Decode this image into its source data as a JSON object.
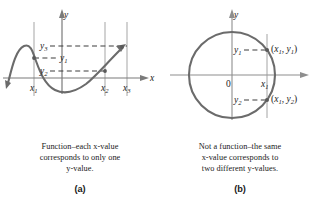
{
  "figure_a": {
    "name": "function-graph",
    "axis_labels": {
      "x": "x",
      "y": "y"
    },
    "y_ticks": [
      "y3",
      "y1",
      "y2"
    ],
    "x_ticks": [
      "x1",
      "x2",
      "x3"
    ],
    "y_tick_base": "y",
    "x_tick_base": "x",
    "y_tick_subs": [
      "3",
      "1",
      "2"
    ],
    "x_tick_subs": [
      "1",
      "2",
      "3"
    ],
    "caption_line1": "Function–each x-value",
    "caption_line2": "corresponds to only one",
    "caption_line3": "y-value.",
    "caption_full": "Function–each x-value corresponds to only one y-value.",
    "sublabel": "(a)",
    "curve_color": "#6b6b6b",
    "axis_color": "#6b6b6b",
    "grid_color": "#8e8e8e",
    "dash_color": "#4a4a4a"
  },
  "figure_b": {
    "name": "not-a-function-graph",
    "axis_labels": {
      "x": "",
      "y": "y"
    },
    "origin_label": "0",
    "y_ticks": [
      "y1",
      "y2"
    ],
    "x_ticks": [
      "x1"
    ],
    "y_tick_base": "y",
    "x_tick_base": "x",
    "y_tick_subs": [
      "1",
      "2"
    ],
    "x_tick_subs": [
      "1"
    ],
    "point_upper": "(x1, y1)",
    "point_lower": "(x1, y2)",
    "point_upper_parts": {
      "open": "(",
      "x": "x",
      "xs": "1",
      "comma": ", ",
      "y": "y",
      "ys": "1",
      "close": ")"
    },
    "point_lower_parts": {
      "open": "(",
      "x": "x",
      "xs": "1",
      "comma": ", ",
      "y": "y",
      "ys": "2",
      "close": ")"
    },
    "caption_line1": "Not a function–the same",
    "caption_line2": "x-value corresponds to",
    "caption_line3": "two different y-values.",
    "caption_full": "Not a function–the same x-value corresponds to two different y-values.",
    "sublabel": "(b)",
    "curve_color": "#6b6b6b",
    "axis_color": "#8e8e8e",
    "grid_color": "#9a9a9a",
    "dash_color": "#4a4a4a"
  }
}
